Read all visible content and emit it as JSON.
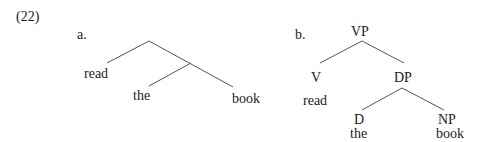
{
  "example_number": "(22)",
  "tree_a": {
    "label": "a.",
    "leaves": [
      "read",
      "the",
      "book"
    ]
  },
  "tree_b": {
    "label": "b.",
    "root": "VP",
    "v_node": "V",
    "v_word": "read",
    "dp_node": "DP",
    "d_node": "D",
    "d_word": "the",
    "np_node": "NP",
    "np_word": "book"
  }
}
